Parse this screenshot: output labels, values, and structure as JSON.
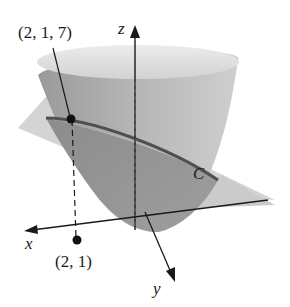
{
  "figure": {
    "type": "3d-surface-diagram",
    "labels": {
      "z_axis": "z",
      "x_axis": "x",
      "y_axis": "y",
      "curve": "C",
      "point_3d": "(2, 1, 7)",
      "point_2d": "(2, 1)"
    },
    "colors": {
      "surface_light": "#d6d6d6",
      "surface_mid": "#a9a9a9",
      "surface_dark": "#8a8a8a",
      "plane": "#c8c8c8",
      "curve": "#555555",
      "axes": "#1a1a1a",
      "point": "#111111"
    }
  }
}
